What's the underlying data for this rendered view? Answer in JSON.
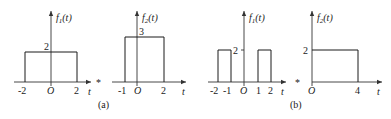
{
  "figure": {
    "panels": [
      {
        "caption": "(a)",
        "operator": "*",
        "signals": [
          {
            "name": "f1(t)",
            "label_f": "f",
            "label_sub": "1",
            "label_arg": "(t)",
            "amplitude_label": "2",
            "origin_label": "O",
            "axis_var": "t",
            "tick_labels": [
              "-2",
              "2"
            ],
            "pulses": [
              {
                "start": -2,
                "end": 2,
                "height": 2
              }
            ]
          },
          {
            "name": "f2(t)",
            "label_f": "f",
            "label_sub": "2",
            "label_arg": "(t)",
            "amplitude_label": "3",
            "origin_label": "O",
            "axis_var": "t",
            "tick_labels": [
              "-1",
              "2"
            ],
            "pulses": [
              {
                "start": -1,
                "end": 2,
                "height": 3
              }
            ]
          }
        ]
      },
      {
        "caption": "(b)",
        "operator": "*",
        "signals": [
          {
            "name": "f1(t)",
            "label_f": "f",
            "label_sub": "1",
            "label_arg": "(t)",
            "amplitude_label": "2",
            "origin_label": "O",
            "axis_var": "t",
            "tick_labels": [
              "-2",
              "-1",
              "1",
              "2"
            ],
            "pulses": [
              {
                "start": -2,
                "end": -1,
                "height": 2
              },
              {
                "start": 1,
                "end": 2,
                "height": 2
              }
            ]
          },
          {
            "name": "f2(t)",
            "label_f": "f",
            "label_sub": "2",
            "label_arg": "(t)",
            "amplitude_label": "2",
            "origin_label": "O",
            "axis_var": "t",
            "tick_labels": [
              "4"
            ],
            "pulses": [
              {
                "start": 0,
                "end": 4,
                "height": 2
              }
            ]
          }
        ]
      }
    ]
  }
}
